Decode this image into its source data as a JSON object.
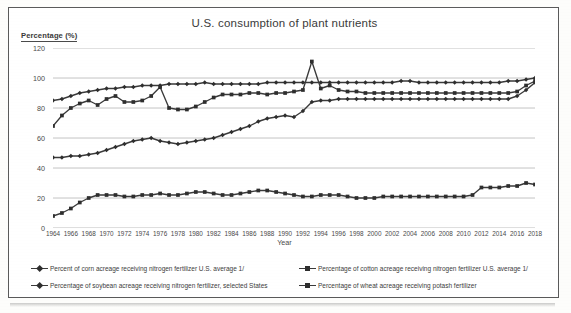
{
  "chart_data": {
    "type": "line",
    "title": "U.S. consumption of plant nutrients",
    "xlabel": "Year",
    "ylabel": "Percentage (%)",
    "ylim": [
      0,
      120
    ],
    "yticks": [
      0,
      20,
      40,
      60,
      80,
      100,
      120
    ],
    "grid": true,
    "legend_position": "bottom",
    "x": [
      1964,
      1965,
      1966,
      1967,
      1968,
      1969,
      1970,
      1971,
      1972,
      1973,
      1974,
      1975,
      1976,
      1977,
      1978,
      1979,
      1980,
      1981,
      1982,
      1983,
      1984,
      1985,
      1986,
      1987,
      1988,
      1989,
      1990,
      1991,
      1992,
      1993,
      1994,
      1995,
      1996,
      1997,
      1998,
      1999,
      2000,
      2001,
      2002,
      2003,
      2004,
      2005,
      2006,
      2007,
      2008,
      2009,
      2010,
      2011,
      2012,
      2013,
      2014,
      2015,
      2016,
      2017,
      2018
    ],
    "xticks": [
      1964,
      1966,
      1968,
      1970,
      1972,
      1974,
      1976,
      1978,
      1980,
      1982,
      1984,
      1986,
      1988,
      1990,
      1992,
      1994,
      1996,
      1998,
      2000,
      2002,
      2004,
      2006,
      2008,
      2010,
      2012,
      2014,
      2016,
      2018
    ],
    "series": [
      {
        "name": "Percent of corn acreage receiving nitrogen fertilizer U.S. average 1/",
        "marker": "diamond",
        "values": [
          85,
          86,
          88,
          90,
          91,
          92,
          93,
          93,
          94,
          94,
          95,
          95,
          95,
          96,
          96,
          96,
          96,
          97,
          96,
          96,
          96,
          96,
          96,
          96,
          97,
          97,
          97,
          97,
          97,
          97,
          97,
          97,
          97,
          97,
          97,
          97,
          97,
          97,
          97,
          98,
          98,
          97,
          97,
          97,
          97,
          97,
          97,
          97,
          97,
          97,
          97,
          98,
          98,
          99,
          100
        ]
      },
      {
        "name": "Percentage of cotton acreage receiving nitrogen fertilizer U.S. average 1/",
        "marker": "square",
        "values": [
          68,
          75,
          80,
          83,
          85,
          82,
          86,
          88,
          84,
          84,
          85,
          88,
          94,
          80,
          79,
          79,
          81,
          84,
          87,
          89,
          89,
          89,
          90,
          90,
          89,
          90,
          90,
          91,
          92,
          111,
          93,
          95,
          92,
          91,
          91,
          90,
          90,
          90,
          90,
          90,
          90,
          90,
          90,
          90,
          90,
          90,
          90,
          90,
          90,
          90,
          90,
          90,
          91,
          95,
          98
        ]
      },
      {
        "name": "Percentage of soybean acreage receiving nitrogen fertilizer, selected States",
        "marker": "diamond",
        "values": [
          47,
          47,
          48,
          48,
          49,
          50,
          52,
          54,
          56,
          58,
          59,
          60,
          58,
          57,
          56,
          57,
          58,
          59,
          60,
          62,
          64,
          66,
          68,
          71,
          73,
          74,
          75,
          74,
          78,
          84,
          85,
          85,
          86,
          86,
          86,
          86,
          86,
          86,
          86,
          86,
          86,
          86,
          86,
          86,
          86,
          86,
          86,
          86,
          86,
          86,
          86,
          86,
          88,
          92,
          97
        ]
      },
      {
        "name": "Percentage of wheat acreage receiving potash fertilizer",
        "marker": "square",
        "values": [
          8,
          10,
          13,
          17,
          20,
          22,
          22,
          22,
          21,
          21,
          22,
          22,
          23,
          22,
          22,
          23,
          24,
          24,
          23,
          22,
          22,
          23,
          24,
          25,
          25,
          24,
          23,
          22,
          21,
          21,
          22,
          22,
          22,
          21,
          20,
          20,
          20,
          21,
          21,
          21,
          21,
          21,
          21,
          21,
          21,
          21,
          21,
          22,
          27,
          27,
          27,
          28,
          28,
          30,
          29
        ]
      }
    ]
  },
  "legend": [
    {
      "label": "Percent of corn acreage receiving nitrogen fertilizer U.S. average 1/",
      "marker": "diamond"
    },
    {
      "label": "Percentage of cotton acreage receiving nitrogen fertilizer U.S. average 1/",
      "marker": "square"
    },
    {
      "label": "Percentage of soybean acreage receiving nitrogen fertilizer, selected States",
      "marker": "diamond"
    },
    {
      "label": "Percentage of wheat acreage receiving potash fertilizer",
      "marker": "square"
    }
  ],
  "colors": {
    "line": "#3a3a3a",
    "marker": "#2e2e2e",
    "grid": "#bdbdbd",
    "axis_text": "#4a4a4a",
    "frame": "#5a5a5a",
    "background": "#ffffff"
  }
}
